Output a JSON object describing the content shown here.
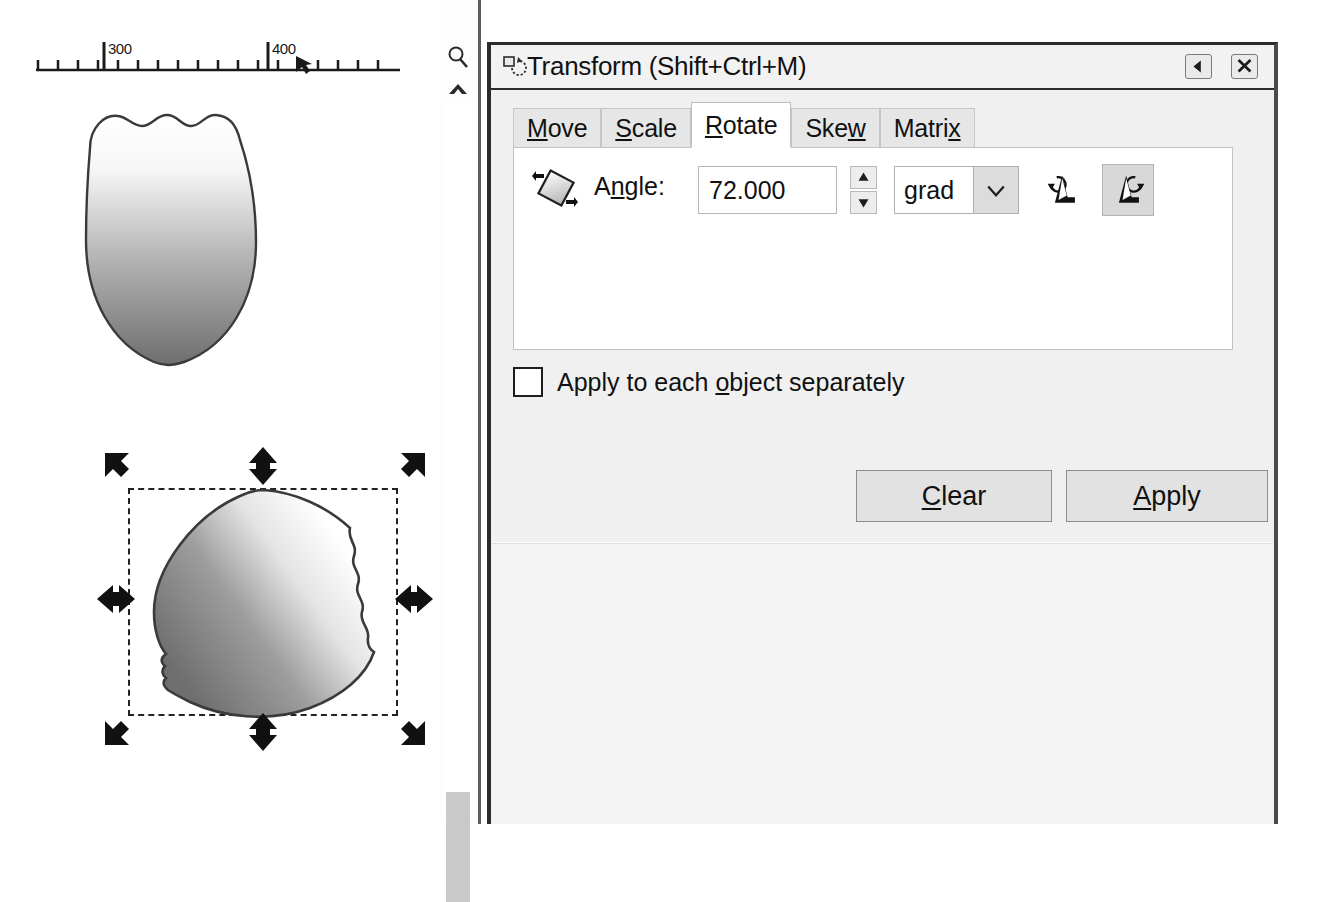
{
  "canvas": {
    "ruler": {
      "labels": [
        "300",
        "400"
      ],
      "cursor_marker": "pointer-marker"
    },
    "zoom_icon": "magnifier-icon",
    "scroll_up_icon": "chevron-up-icon",
    "scrollbar": "vertical-scrollbar",
    "objects": [
      {
        "name": "leaf-shape-original",
        "description": "leaf shape with scalloped top edge, white-to-gray gradient",
        "selected": "false"
      },
      {
        "name": "leaf-shape-rotated",
        "description": "rotated leaf shape with selection handles",
        "selected": "true"
      }
    ],
    "selection_handles": 8
  },
  "dialog": {
    "title": "Transform (Shift+Ctrl+M)",
    "title_icon": "transform-rotate-icon",
    "dock_button_icon": "arrow-left-icon",
    "close_button_icon": "close-x-icon",
    "tabs": [
      {
        "label": "Move",
        "mnemonic": "M",
        "active": "false"
      },
      {
        "label": "Scale",
        "mnemonic": "S",
        "active": "false"
      },
      {
        "label": "Rotate",
        "mnemonic": "R",
        "active": "true"
      },
      {
        "label": "Skew",
        "mnemonic": "w",
        "active": "false"
      },
      {
        "label": "Matrix",
        "mnemonic": "x",
        "active": "false"
      }
    ],
    "rotate_tab": {
      "icon": "rotate-object-icon",
      "angle_label": "Angle:",
      "angle_label_pre": "A",
      "angle_label_mnemonic": "n",
      "angle_label_post": "gle:",
      "angle_value": "72.000",
      "angle_placeholder": "0.000",
      "spinner_up_icon": "spinner-up-icon",
      "spinner_down_icon": "spinner-down-icon",
      "unit_value": "grad",
      "unit_options": [
        "deg",
        "grad",
        "rad",
        "turn"
      ],
      "unit_arrow_icon": "chevron-down-icon",
      "rotate_ccw_icon": "rotate-counterclockwise-icon",
      "rotate_cw_icon": "rotate-clockwise-icon",
      "rotate_ccw_active": "false",
      "rotate_cw_active": "true"
    },
    "apply_each": {
      "label_pre": "Apply to each ",
      "label_mnemonic": "o",
      "label_post": "bject separately",
      "checked": "false"
    },
    "buttons": {
      "clear_pre": "",
      "clear_mnemonic": "C",
      "clear_post": "lear",
      "apply_mnemonic": "A",
      "apply_post": "pply"
    }
  },
  "colors": {
    "dialog_bg": "#f0f0f0",
    "tab_active_bg": "#ffffff",
    "tab_inactive_bg": "#e6e6e6",
    "button_bg": "#e2e2e2",
    "border_dark": "#2b2b2b",
    "pressed_bg": "#d8d8d8",
    "scrollbar_thumb": "#c9c9c9",
    "text": "#111111"
  }
}
